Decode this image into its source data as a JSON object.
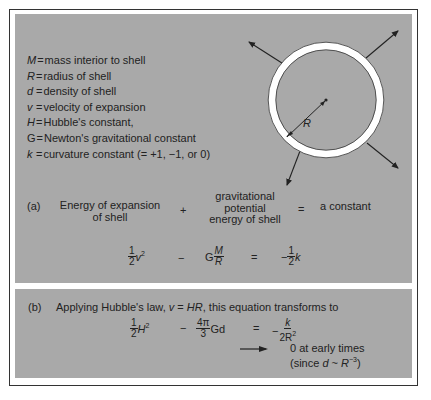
{
  "definitions": [
    {
      "symbol": "M",
      "eq": "=",
      "text": "mass interior to shell"
    },
    {
      "symbol": "R",
      "eq": "=",
      "text": "radius of shell"
    },
    {
      "symbol": "d",
      "eq": "=",
      "text": "density of shell"
    },
    {
      "symbol": "v",
      "eq": "=",
      "text": "velocity of expansion"
    },
    {
      "symbol": "H",
      "eq": "=",
      "text": "Hubble's constant,"
    },
    {
      "symbol": "G",
      "eq": "=",
      "text": "Newton's gravitational constant"
    },
    {
      "symbol": "k",
      "eq": "=",
      "text": "curvature constant (= +1, −1, or 0)"
    }
  ],
  "diagram": {
    "radius_label": "R",
    "colors": {
      "panel": "#a9a9a9",
      "shell": "#ffffff",
      "stroke": "#222222"
    }
  },
  "part_a": {
    "label": "(a)",
    "term1_line1": "Energy of expansion",
    "term1_line2": "of shell",
    "plus": "+",
    "term2_line1": "gravitational",
    "term2_line2": "potential",
    "term2_line3": "energy of shell",
    "equals": "=",
    "rhs": "a constant",
    "eq": {
      "t1_num": "1",
      "t1_den": "2",
      "t1_var": "v",
      "t1_exp": "2",
      "op1": "−",
      "t2_coef": "G",
      "t2_num": "M",
      "t2_den": "R",
      "op2": "=",
      "rhs_sign": "−",
      "rhs_num": "1",
      "rhs_den": "2",
      "rhs_var": "k"
    }
  },
  "part_b": {
    "label": "(b)",
    "intro_pre": "Applying Hubble's law, ",
    "intro_law_v": "v",
    "intro_law_eq": " = ",
    "intro_law_hr": "HR",
    "intro_post": ", this equation transforms to",
    "eq": {
      "t1_num": "1",
      "t1_den": "2",
      "t1_var": "H",
      "t1_exp": "2",
      "op1": "−",
      "t2_num": "4π",
      "t2_den": "3",
      "t2_tail": "Gd",
      "op2": "=",
      "rhs_sign": "−",
      "rhs_num": "k",
      "rhs_den": "2R",
      "rhs_exp": "2"
    },
    "note_line1": "0 at early times",
    "note_pre": "(since ",
    "note_d": "d",
    "note_sim": " ~ ",
    "note_r": "R",
    "note_exp": "−3",
    "note_close": ")"
  }
}
